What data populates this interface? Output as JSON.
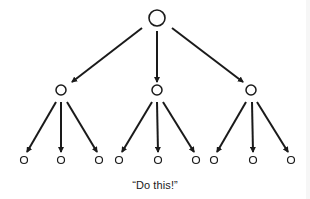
{
  "diagram": {
    "type": "tree",
    "caption": "“Do this!”",
    "colors": {
      "stroke": "#1a1a1a",
      "background": "#ffffff"
    },
    "root": {
      "id": "root",
      "x": 157,
      "y": 18,
      "r": 8
    },
    "level1": [
      {
        "id": "mid-left",
        "x": 61,
        "y": 90,
        "r": 5
      },
      {
        "id": "mid-center",
        "x": 157,
        "y": 90,
        "r": 5
      },
      {
        "id": "mid-right",
        "x": 251,
        "y": 90,
        "r": 5
      }
    ],
    "level2": [
      {
        "id": "leaf-1",
        "parent": "mid-left",
        "x": 24,
        "y": 160,
        "r": 3.5
      },
      {
        "id": "leaf-2",
        "parent": "mid-left",
        "x": 61,
        "y": 160,
        "r": 3.5
      },
      {
        "id": "leaf-3",
        "parent": "mid-left",
        "x": 99,
        "y": 160,
        "r": 3.5
      },
      {
        "id": "leaf-4",
        "parent": "mid-center",
        "x": 119,
        "y": 160,
        "r": 3.5
      },
      {
        "id": "leaf-5",
        "parent": "mid-center",
        "x": 158,
        "y": 160,
        "r": 3.5
      },
      {
        "id": "leaf-6",
        "parent": "mid-center",
        "x": 196,
        "y": 160,
        "r": 3.5
      },
      {
        "id": "leaf-7",
        "parent": "mid-right",
        "x": 214,
        "y": 160,
        "r": 3.5
      },
      {
        "id": "leaf-8",
        "parent": "mid-right",
        "x": 253,
        "y": 160,
        "r": 3.5
      },
      {
        "id": "leaf-9",
        "parent": "mid-right",
        "x": 291,
        "y": 160,
        "r": 3.5
      }
    ],
    "edges_top": [
      {
        "from": "root",
        "to": "mid-left",
        "x1": 142,
        "y1": 28,
        "x2": 72,
        "y2": 82
      },
      {
        "from": "root",
        "to": "mid-center",
        "x1": 157,
        "y1": 31,
        "x2": 157,
        "y2": 82
      },
      {
        "from": "root",
        "to": "mid-right",
        "x1": 172,
        "y1": 28,
        "x2": 243,
        "y2": 82
      }
    ],
    "edges_bottom": [
      {
        "from": "mid-left",
        "to": "leaf-1",
        "x1": 56,
        "y1": 102,
        "x2": 27,
        "y2": 152
      },
      {
        "from": "mid-left",
        "to": "leaf-2",
        "x1": 61,
        "y1": 102,
        "x2": 61,
        "y2": 152
      },
      {
        "from": "mid-left",
        "to": "leaf-3",
        "x1": 67,
        "y1": 102,
        "x2": 97,
        "y2": 152
      },
      {
        "from": "mid-center",
        "to": "leaf-4",
        "x1": 152,
        "y1": 102,
        "x2": 122,
        "y2": 152
      },
      {
        "from": "mid-center",
        "to": "leaf-5",
        "x1": 157,
        "y1": 102,
        "x2": 158,
        "y2": 152
      },
      {
        "from": "mid-center",
        "to": "leaf-6",
        "x1": 163,
        "y1": 102,
        "x2": 194,
        "y2": 152
      },
      {
        "from": "mid-right",
        "to": "leaf-7",
        "x1": 246,
        "y1": 102,
        "x2": 217,
        "y2": 152
      },
      {
        "from": "mid-right",
        "to": "leaf-8",
        "x1": 252,
        "y1": 102,
        "x2": 253,
        "y2": 152
      },
      {
        "from": "mid-right",
        "to": "leaf-9",
        "x1": 257,
        "y1": 102,
        "x2": 288,
        "y2": 152
      }
    ]
  }
}
